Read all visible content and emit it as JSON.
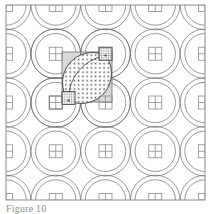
{
  "figure": {
    "caption": "Figure 10",
    "background_color": "#ffffff"
  },
  "canvas": {
    "width": 212,
    "height": 214
  },
  "frame": {
    "x": 6,
    "y": 5,
    "width": 199,
    "height": 195,
    "stroke": "#8c8c8c",
    "stroke_width": 1
  },
  "grid": {
    "columns": 4,
    "rows": 4,
    "cell_size": 49.75,
    "origin_x": 6,
    "origin_y": 5,
    "circle_radius": 24.8,
    "stroke": "#6b6b6b",
    "stroke_width": 0.7,
    "inner_ring_offset": 4.6
  },
  "junction_blocks": {
    "label": "melon junction square",
    "size": 13,
    "stroke": "#8c8c8c",
    "stroke_width": 0.8,
    "fill": "none",
    "divider": true
  },
  "highlight_cell": {
    "label": "highlighted patch cell",
    "x": 62,
    "y": 52,
    "width": 50,
    "height": 50,
    "fill": "#d9d9d5",
    "stroke": "#6b6b6b",
    "stroke_width": 0.8
  },
  "lens": {
    "label": "vesica melon patch",
    "fill_pattern": "dots",
    "dot_color": "#4a4a4a",
    "dot_radius": 0.85,
    "dot_spacing": 6,
    "stroke": "#3a3a3a",
    "stroke_width": 0.9,
    "tip_top_x": 105,
    "tip_top_y": 55,
    "tip_bottom_x": 69,
    "tip_bottom_y": 100,
    "center_seam": true
  },
  "lens_tip_blocks": {
    "label": "cross-hatched corner block",
    "pattern": "grid-hatch",
    "size": 13,
    "hatch_spacing": 2.2,
    "hatch_color": "#4a4a4a",
    "stroke": "#3a3a3a",
    "positions": [
      {
        "x": 98,
        "y": 48
      },
      {
        "x": 62,
        "y": 92
      }
    ]
  },
  "colors": {
    "line": "#6b6b6b",
    "frame": "#8c8c8c",
    "shade": "#d9d9d5",
    "dark_line": "#3a3a3a",
    "caption": "#8a8a8a",
    "background": "#ffffff"
  }
}
